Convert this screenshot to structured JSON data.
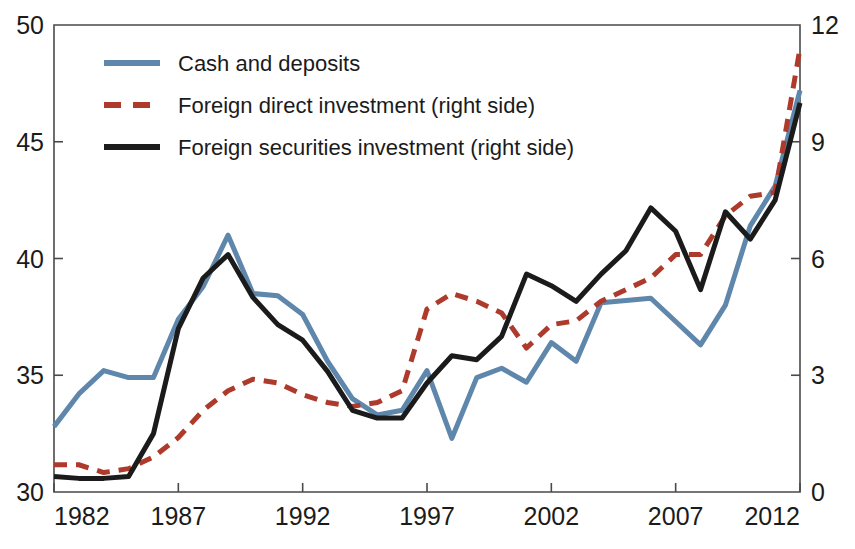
{
  "chart_data": {
    "type": "line",
    "title": "",
    "subtitle": "",
    "xlabel": "",
    "ylabel": "",
    "y2label": "",
    "grid": false,
    "legend_position": "top-left",
    "x": [
      1982,
      1983,
      1984,
      1985,
      1986,
      1987,
      1988,
      1989,
      1990,
      1991,
      1992,
      1993,
      1994,
      1995,
      1996,
      1997,
      1998,
      1999,
      2000,
      2001,
      2002,
      2003,
      2004,
      2005,
      2006,
      2007,
      2008,
      2009,
      2010,
      2011,
      2012
    ],
    "xlim": [
      1982,
      2012
    ],
    "xticks": [
      1982,
      1987,
      1992,
      1997,
      2002,
      2007,
      2012
    ],
    "xticklabels": [
      "1982",
      "1987",
      "1992",
      "1997",
      "2002",
      "2007",
      "2012"
    ],
    "ylim": [
      30,
      50
    ],
    "yticks": [
      30,
      35,
      40,
      45,
      50
    ],
    "yticklabels": [
      "30",
      "35",
      "40",
      "45",
      "50"
    ],
    "y2lim": [
      0,
      12
    ],
    "y2ticks": [
      0,
      3,
      6,
      9,
      12
    ],
    "y2ticklabels": [
      "0",
      "3",
      "6",
      "9",
      "12"
    ],
    "series": [
      {
        "name": "Cash and deposits",
        "axis": "left",
        "color": "#5f87ab",
        "style": "solid",
        "width": 5,
        "values": [
          32.8,
          34.2,
          35.2,
          34.9,
          34.9,
          37.4,
          38.8,
          41.0,
          38.5,
          38.4,
          37.6,
          35.6,
          34.0,
          33.3,
          33.5,
          35.2,
          32.3,
          34.9,
          35.3,
          34.7,
          36.4,
          35.6,
          38.1,
          38.2,
          38.3,
          37.3,
          36.3,
          38.0,
          41.4,
          43.1,
          47.2
        ]
      },
      {
        "name": "Foreign direct investment (right side)",
        "axis": "right",
        "color": "#ad3a2b",
        "style": "dashed",
        "width": 5,
        "values": [
          0.7,
          0.7,
          0.5,
          0.6,
          0.9,
          1.4,
          2.1,
          2.6,
          2.9,
          2.8,
          2.5,
          2.3,
          2.2,
          2.3,
          2.6,
          4.7,
          5.1,
          4.9,
          4.6,
          3.7,
          4.3,
          4.4,
          4.9,
          5.2,
          5.5,
          6.1,
          6.1,
          7.1,
          7.6,
          7.7,
          11.4
        ]
      },
      {
        "name": "Foreign securities investment (right side)",
        "axis": "right",
        "color": "#1b1b1b",
        "style": "solid",
        "width": 5,
        "values": [
          0.4,
          0.35,
          0.35,
          0.4,
          1.5,
          4.2,
          5.5,
          6.1,
          5.0,
          4.3,
          3.9,
          3.1,
          2.1,
          1.9,
          1.9,
          2.8,
          3.5,
          3.4,
          4.0,
          5.6,
          5.3,
          4.9,
          5.6,
          6.2,
          7.3,
          6.7,
          5.2,
          7.2,
          6.5,
          7.5,
          10.0
        ]
      }
    ]
  },
  "legend": {
    "items": [
      {
        "label": "Cash and deposits",
        "color": "#5f87ab",
        "style": "solid"
      },
      {
        "label": "Foreign direct investment (right side)",
        "color": "#ad3a2b",
        "style": "dashed"
      },
      {
        "label": "Foreign securities investment (right side)",
        "color": "#1b1b1b",
        "style": "solid"
      }
    ]
  }
}
